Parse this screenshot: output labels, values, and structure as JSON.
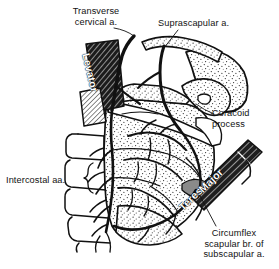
{
  "figure": {
    "background_color": "#ffffff",
    "ink_color": "#111111"
  },
  "labels": [
    {
      "id": "transverse",
      "name": "transverse-cervical-artery",
      "lines": [
        "Transverse",
        "cervical a."
      ],
      "align": "center"
    },
    {
      "id": "suprascap",
      "name": "suprascapular-artery",
      "lines": [
        "Suprascapular a."
      ],
      "align": "left"
    },
    {
      "id": "coracoid",
      "name": "coracoid-process",
      "lines": [
        "Coracoid",
        "process"
      ],
      "align": "left"
    },
    {
      "id": "intercostal",
      "name": "intercostal-arteries",
      "lines": [
        "Intercostal aa."
      ],
      "align": "left"
    },
    {
      "id": "circumflex",
      "name": "circumflex-scapular-branch",
      "lines": [
        "Circumflex",
        "scapular br. of",
        "subscapular a."
      ],
      "align": "center"
    }
  ],
  "muscle_labels": [
    {
      "id": "levator",
      "name": "levator-scapulae-muscle",
      "text": "Levator"
    },
    {
      "id": "teres",
      "name": "teres-major-muscle",
      "text": "Teres"
    },
    {
      "id": "major",
      "name": "teres-major-muscle-2",
      "text": "Major"
    }
  ],
  "text": {
    "transverse_l1": "Transverse",
    "transverse_l2": "cervical a.",
    "suprascap_l1": "Suprascapular a.",
    "coracoid_l1": "Coracoid",
    "coracoid_l2": "process",
    "intercostal_l1": "Intercostal aa.",
    "circumflex_l1": "Circumflex",
    "circumflex_l2": "scapular br. of",
    "circumflex_l3": "subscapular a.",
    "levator": "Levator",
    "teres": "Teres",
    "major": "Major"
  }
}
